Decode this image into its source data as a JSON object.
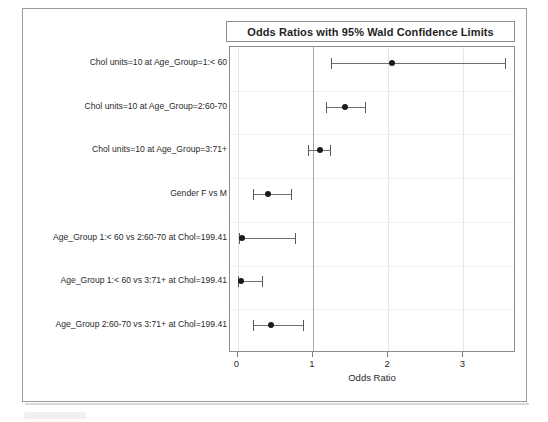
{
  "chart_data": {
    "type": "forest",
    "title": "Odds Ratios with 95% Wald Confidence Limits",
    "xlabel": "Odds Ratio",
    "ylabel": "",
    "xlim": [
      -0.1,
      3.7
    ],
    "xticks": [
      0,
      1,
      2,
      3
    ],
    "xtick_labels": [
      "0",
      "1",
      "2",
      "3"
    ],
    "reference_line": 1,
    "grid": true,
    "legend": "none",
    "categories": [
      "Chol units=10 at Age_Group=1:< 60",
      "Chol units=10 at Age_Group=2:60-70",
      "Chol units=10 at Age_Group=3:71+",
      "Gender F vs M",
      "Age_Group 1:< 60 vs 2:60-70 at Chol=199.41",
      "Age_Group 1:< 60 vs 3:71+ at Chol=199.41",
      "Age_Group 2:60-70 vs 3:71+ at Chol=199.41"
    ],
    "series": [
      {
        "name": "Odds Ratio estimate",
        "estimates": [
          2.05,
          1.43,
          1.09,
          0.4,
          0.06,
          0.04,
          0.45
        ],
        "lower": [
          1.24,
          1.17,
          0.93,
          0.21,
          0.02,
          0.01,
          0.21
        ],
        "upper": [
          3.55,
          1.7,
          1.23,
          0.71,
          0.77,
          0.32,
          0.87
        ]
      }
    ]
  },
  "axis": {
    "x_title": "Odds Ratio"
  }
}
